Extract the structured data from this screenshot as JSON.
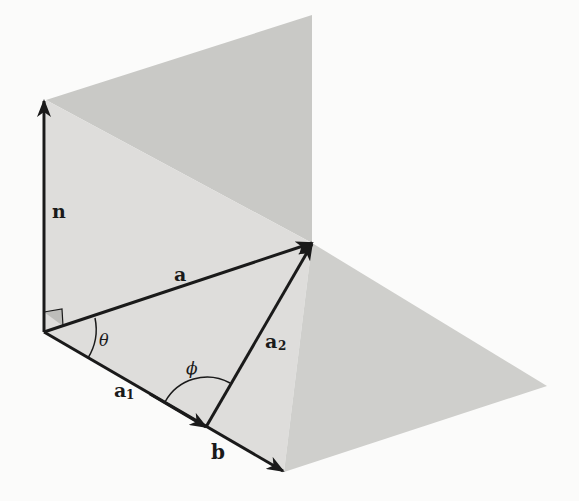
{
  "figure": {
    "colors": {
      "background": "#fbfbfa",
      "vertical_plane_upper": "#c9c9c6",
      "vertical_plane_lower": "#dedddb",
      "horizontal_plane": "#cfcfcc",
      "ink": "#1a1a1a"
    },
    "vectors": [
      {
        "id": "n",
        "label": "n",
        "from": [
          44,
          332
        ],
        "to": [
          44,
          100
        ]
      },
      {
        "id": "a",
        "label": "a",
        "from": [
          44,
          332
        ],
        "to": [
          313,
          243
        ]
      },
      {
        "id": "a1",
        "label": "a",
        "subscript": "1",
        "from": [
          44,
          332
        ],
        "to": [
          205,
          427
        ]
      },
      {
        "id": "b",
        "label": "b",
        "from": [
          44,
          332
        ],
        "to": [
          284,
          472
        ]
      },
      {
        "id": "a2",
        "label": "a",
        "subscript": "2",
        "from": [
          205,
          427
        ],
        "to": [
          313,
          243
        ]
      }
    ],
    "angles": [
      {
        "id": "theta",
        "label": "θ"
      },
      {
        "id": "phi",
        "label": "ϕ"
      }
    ],
    "right_angle_marker": true
  },
  "labels": {
    "n": "n",
    "a": "a",
    "a1_main": "a",
    "a1_sub": "1",
    "a2_main": "a",
    "a2_sub": "2",
    "b": "b",
    "theta": "θ",
    "phi": "ϕ"
  }
}
